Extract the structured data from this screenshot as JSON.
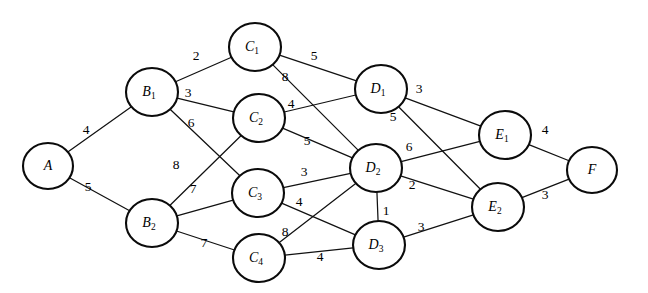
{
  "figure": {
    "top_caption_fragment": "",
    "width": 648,
    "height": 293,
    "node_radius": 23,
    "background_color": "#ffffff",
    "stroke_color": "#0b0b0b"
  },
  "nodes": [
    {
      "id": "A",
      "letter": "A",
      "sub": "",
      "x": 48,
      "y": 166,
      "rx": 25,
      "ry": 23
    },
    {
      "id": "B1",
      "letter": "B",
      "sub": "1",
      "x": 152,
      "y": 92,
      "rx": 26,
      "ry": 24
    },
    {
      "id": "B2",
      "letter": "B",
      "sub": "2",
      "x": 152,
      "y": 223,
      "rx": 26,
      "ry": 24
    },
    {
      "id": "C1",
      "letter": "C",
      "sub": "1",
      "x": 255,
      "y": 47,
      "rx": 26,
      "ry": 24
    },
    {
      "id": "C2",
      "letter": "C",
      "sub": "2",
      "x": 259,
      "y": 118,
      "rx": 26,
      "ry": 24
    },
    {
      "id": "C3",
      "letter": "C",
      "sub": "3",
      "x": 258,
      "y": 193,
      "rx": 26,
      "ry": 24
    },
    {
      "id": "C4",
      "letter": "C",
      "sub": "4",
      "x": 259,
      "y": 258,
      "rx": 26,
      "ry": 24
    },
    {
      "id": "D1",
      "letter": "D",
      "sub": "1",
      "x": 381,
      "y": 89,
      "rx": 26,
      "ry": 24
    },
    {
      "id": "D2",
      "letter": "D",
      "sub": "2",
      "x": 376,
      "y": 168,
      "rx": 26,
      "ry": 24
    },
    {
      "id": "D3",
      "letter": "D",
      "sub": "3",
      "x": 379,
      "y": 245,
      "rx": 26,
      "ry": 24
    },
    {
      "id": "E1",
      "letter": "E",
      "sub": "1",
      "x": 505,
      "y": 135,
      "rx": 26,
      "ry": 24
    },
    {
      "id": "E2",
      "letter": "E",
      "sub": "2",
      "x": 498,
      "y": 207,
      "rx": 26,
      "ry": 24
    },
    {
      "id": "F",
      "letter": "F",
      "sub": "",
      "x": 592,
      "y": 170,
      "rx": 25,
      "ry": 23
    }
  ],
  "edges": [
    {
      "from": "A",
      "to": "B1",
      "weight": "4",
      "lx": 86,
      "ly": 131
    },
    {
      "from": "A",
      "to": "B2",
      "weight": "5",
      "lx": 88,
      "ly": 188
    },
    {
      "from": "B1",
      "to": "C1",
      "weight": "2",
      "lx": 196,
      "ly": 57
    },
    {
      "from": "B1",
      "to": "C2",
      "weight": "3",
      "lx": 188,
      "ly": 94
    },
    {
      "from": "B1",
      "to": "C3",
      "weight": "6",
      "lx": 191,
      "ly": 124
    },
    {
      "from": "B2",
      "to": "C2",
      "weight": "8",
      "lx": 176,
      "ly": 166
    },
    {
      "from": "B2",
      "to": "C3",
      "weight": "7",
      "lx": 193,
      "ly": 190
    },
    {
      "from": "B2",
      "to": "C4",
      "weight": "7",
      "lx": 204,
      "ly": 244
    },
    {
      "from": "C1",
      "to": "D1",
      "weight": "5",
      "lx": 314,
      "ly": 57
    },
    {
      "from": "C1",
      "to": "D2",
      "weight": "8",
      "lx": 285,
      "ly": 78
    },
    {
      "from": "C2",
      "to": "D1",
      "weight": "4",
      "lx": 291,
      "ly": 105
    },
    {
      "from": "C2",
      "to": "D2",
      "weight": "5",
      "lx": 307,
      "ly": 142
    },
    {
      "from": "C3",
      "to": "D2",
      "weight": "3",
      "lx": 304,
      "ly": 173
    },
    {
      "from": "C3",
      "to": "D3",
      "weight": "4",
      "lx": 299,
      "ly": 203
    },
    {
      "from": "C4",
      "to": "D2",
      "weight": "8",
      "lx": 285,
      "ly": 233
    },
    {
      "from": "C4",
      "to": "D3",
      "weight": "4",
      "lx": 320,
      "ly": 258
    },
    {
      "from": "D1",
      "to": "E1",
      "weight": "3",
      "lx": 419,
      "ly": 90
    },
    {
      "from": "D1",
      "to": "E2",
      "weight": "5",
      "lx": 393,
      "ly": 118
    },
    {
      "from": "D2",
      "to": "E1",
      "weight": "6",
      "lx": 409,
      "ly": 148
    },
    {
      "from": "D2",
      "to": "E2",
      "weight": "2",
      "lx": 412,
      "ly": 186
    },
    {
      "from": "D2",
      "to": "D3",
      "weight": "1",
      "lx": 386,
      "ly": 212
    },
    {
      "from": "D3",
      "to": "E2",
      "weight": "3",
      "lx": 421,
      "ly": 228
    },
    {
      "from": "E1",
      "to": "F",
      "weight": "4",
      "lx": 545,
      "ly": 131
    },
    {
      "from": "E2",
      "to": "F",
      "weight": "3",
      "lx": 545,
      "ly": 196
    }
  ],
  "chart_data": {
    "type": "diagram",
    "layers": [
      [
        "A"
      ],
      [
        "B1",
        "B2"
      ],
      [
        "C1",
        "C2",
        "C3",
        "C4"
      ],
      [
        "D1",
        "D2",
        "D3"
      ],
      [
        "E1",
        "E2"
      ],
      [
        "F"
      ]
    ],
    "node_labels": {
      "A": "A",
      "B1": "B₁",
      "B2": "B₂",
      "C1": "C₁",
      "C2": "C₂",
      "C3": "C₃",
      "C4": "C₄",
      "D1": "D₁",
      "D2": "D₂",
      "D3": "D₃",
      "E1": "E₁",
      "E2": "E₂",
      "F": "F"
    },
    "weighted_edges": [
      [
        "A",
        "B1",
        4
      ],
      [
        "A",
        "B2",
        5
      ],
      [
        "B1",
        "C1",
        2
      ],
      [
        "B1",
        "C2",
        3
      ],
      [
        "B1",
        "C3",
        6
      ],
      [
        "B2",
        "C2",
        8
      ],
      [
        "B2",
        "C3",
        7
      ],
      [
        "B2",
        "C4",
        7
      ],
      [
        "C1",
        "D1",
        5
      ],
      [
        "C1",
        "D2",
        8
      ],
      [
        "C2",
        "D1",
        4
      ],
      [
        "C2",
        "D2",
        5
      ],
      [
        "C3",
        "D2",
        3
      ],
      [
        "C3",
        "D3",
        4
      ],
      [
        "C4",
        "D2",
        8
      ],
      [
        "C4",
        "D3",
        4
      ],
      [
        "D1",
        "E1",
        3
      ],
      [
        "D1",
        "E2",
        5
      ],
      [
        "D2",
        "E1",
        6
      ],
      [
        "D2",
        "E2",
        2
      ],
      [
        "D2",
        "D3",
        1
      ],
      [
        "D3",
        "E2",
        3
      ],
      [
        "E1",
        "F",
        4
      ],
      [
        "E2",
        "F",
        3
      ]
    ],
    "weights_list": [
      4,
      5,
      2,
      3,
      6,
      8,
      7,
      7,
      5,
      8,
      4,
      5,
      3,
      4,
      8,
      4,
      3,
      5,
      6,
      2,
      1,
      3,
      4,
      3
    ],
    "node_count": 13,
    "edge_count": 24,
    "source": "A",
    "sink": "F",
    "directed": false,
    "grid": false,
    "legend": null
  }
}
